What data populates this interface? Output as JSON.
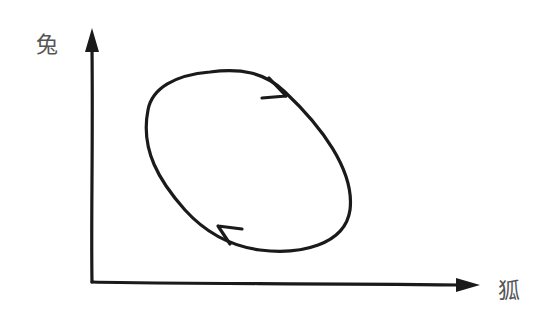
{
  "diagram": {
    "type": "phase-plot",
    "y_axis": {
      "label": "兔"
    },
    "x_axis": {
      "label": "狐"
    },
    "cycle": {
      "direction": "clockwise",
      "arrow_count": 2
    },
    "colors": {
      "stroke": "#1a1a1a",
      "label": "#555555",
      "background": "#ffffff"
    }
  }
}
